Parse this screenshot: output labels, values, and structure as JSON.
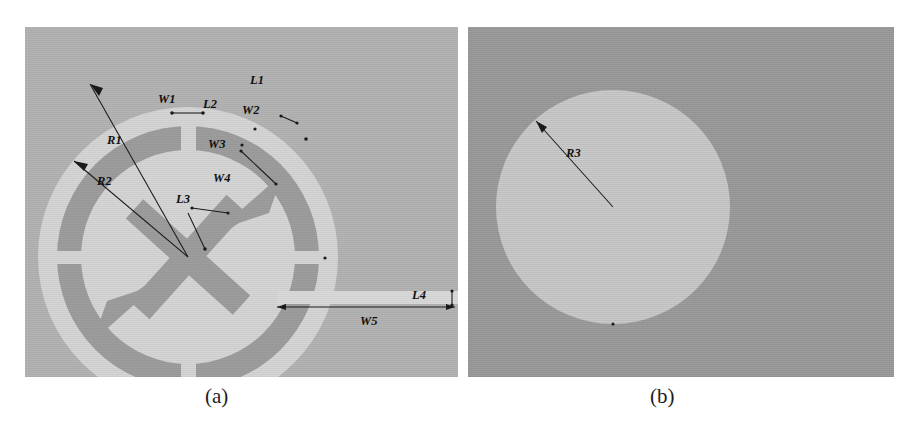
{
  "figure": {
    "type": "antenna-geometry-diagram",
    "panels": [
      {
        "id": "a",
        "caption": "(a)",
        "description": "Slotted circular ring radiating patch with cross-shaped center stub and microstrip feed line",
        "background_color": "#b2b2b2",
        "metal_color": "#d2d2d2",
        "slot_color": "#9a9a9a",
        "labels": [
          {
            "name": "R1",
            "text": "R1",
            "x": 107,
            "y": 140
          },
          {
            "name": "R2",
            "text": "R2",
            "x": 97,
            "y": 181
          },
          {
            "name": "L3",
            "text": "L3",
            "x": 176,
            "y": 199
          },
          {
            "name": "W1",
            "text": "W1",
            "x": 158,
            "y": 99
          },
          {
            "name": "L2",
            "text": "L2",
            "x": 203,
            "y": 104
          },
          {
            "name": "L1",
            "text": "L1",
            "x": 250,
            "y": 80
          },
          {
            "name": "W2",
            "text": "W2",
            "x": 242,
            "y": 110
          },
          {
            "name": "W3",
            "text": "W3",
            "x": 208,
            "y": 144
          },
          {
            "name": "W4",
            "text": "W4",
            "x": 213,
            "y": 178
          },
          {
            "name": "L4",
            "text": "L4",
            "x": 412,
            "y": 295
          },
          {
            "name": "W5",
            "text": "W5",
            "x": 360,
            "y": 321
          }
        ]
      },
      {
        "id": "b",
        "caption": "(b)",
        "description": "Circular ground plane disc",
        "background_color": "#9b9b9b",
        "metal_color": "#c8c8c8",
        "labels": [
          {
            "name": "R3",
            "text": "R3",
            "x": 566,
            "y": 153
          }
        ]
      }
    ]
  }
}
